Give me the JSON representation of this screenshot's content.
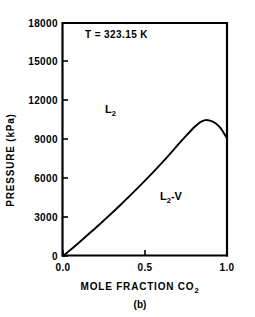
{
  "chart_data": {
    "type": "line",
    "title": "",
    "subtitle": "",
    "panel_label": "(b)",
    "xlabel": "MOLE FRACTION CO",
    "xlabel_subscript": "2",
    "ylabel": "PRESSURE (kPa)",
    "xlim": [
      0.0,
      1.0
    ],
    "ylim": [
      0,
      18000
    ],
    "grid": false,
    "legend": "none",
    "x_ticks": [
      0.0,
      0.5,
      1.0
    ],
    "x_tick_labels": [
      "0.0",
      "0.5",
      "1.0"
    ],
    "y_ticks": [
      0,
      3000,
      6000,
      9000,
      12000,
      15000,
      18000
    ],
    "y_tick_labels": [
      "0",
      "3000",
      "6000",
      "9000",
      "12000",
      "15000",
      "18000"
    ],
    "annotations": [
      {
        "text": "T = 323.15 K",
        "x": 0.14,
        "y": 16200
      },
      {
        "text": "L2",
        "x": 0.26,
        "y": 10900
      },
      {
        "text": "L2-V",
        "x": 0.62,
        "y": 4500
      }
    ],
    "series": [
      {
        "name": "bubble-point curve",
        "x": [
          0.0,
          0.05,
          0.1,
          0.15,
          0.2,
          0.25,
          0.3,
          0.35,
          0.4,
          0.45,
          0.5,
          0.55,
          0.6,
          0.65,
          0.7,
          0.75,
          0.8,
          0.83,
          0.85,
          0.87,
          0.89,
          0.91,
          0.93,
          0.95,
          0.97,
          0.99,
          1.0
        ],
        "values": [
          0,
          520,
          1060,
          1620,
          2180,
          2760,
          3340,
          3940,
          4560,
          5180,
          5820,
          6480,
          7160,
          7860,
          8580,
          9280,
          9950,
          10280,
          10420,
          10500,
          10480,
          10400,
          10250,
          10030,
          9720,
          9300,
          9100
        ]
      }
    ]
  },
  "annotation_labels": {
    "temperature": "T = 323.15 K",
    "region_liquid_base": "L",
    "region_liquid_sub": "2",
    "region_two_phase_base": "L",
    "region_two_phase_sub": "2",
    "region_two_phase_tail": "-V"
  },
  "axes": {
    "y_title": "PRESSURE (kPa)",
    "x_title_base": "MOLE  FRACTION  CO",
    "x_title_sub": "2",
    "panel_caption": "(b)"
  },
  "colors": {
    "background": "#ffffff",
    "foreground": "#000000",
    "curve": "#000000",
    "axis": "#000000"
  }
}
